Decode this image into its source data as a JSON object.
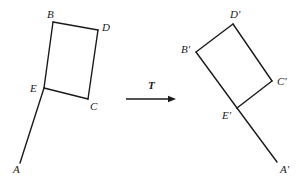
{
  "figure": {
    "caption": "",
    "background_color": "#ffffff",
    "stroke_color": "#1a1a1a",
    "label_color": "#1a1a1a",
    "width": 299,
    "height": 180
  },
  "operator": {
    "symbol": "T",
    "symbol_x": 148,
    "symbol_y": 80,
    "arrow": {
      "x1": 126,
      "y1": 99,
      "x2": 176,
      "y2": 99
    }
  },
  "preimage": {
    "name": "pre-image",
    "vertices": [
      {
        "id": "A",
        "label": "A",
        "x": 20,
        "y": 163,
        "label_x": 13,
        "label_y": 164
      },
      {
        "id": "B",
        "label": "B",
        "x": 53,
        "y": 22,
        "label_x": 47,
        "label_y": 9
      },
      {
        "id": "C",
        "label": "C",
        "x": 88,
        "y": 99,
        "label_x": 90,
        "label_y": 101
      },
      {
        "id": "D",
        "label": "D",
        "x": 98,
        "y": 30,
        "label_x": 102,
        "label_y": 22
      },
      {
        "id": "E",
        "label": "E",
        "x": 44,
        "y": 88,
        "label_x": 30,
        "label_y": 83
      }
    ],
    "edges": [
      {
        "from": "B",
        "to": "D"
      },
      {
        "from": "D",
        "to": "C"
      },
      {
        "from": "C",
        "to": "E"
      },
      {
        "from": "E",
        "to": "B"
      },
      {
        "from": "E",
        "to": "A"
      }
    ]
  },
  "image": {
    "name": "image",
    "vertices": [
      {
        "id": "A'",
        "label": "A'",
        "x": 277,
        "y": 162,
        "label_x": 280,
        "label_y": 164
      },
      {
        "id": "B'",
        "label": "B'",
        "x": 196,
        "y": 52,
        "label_x": 181,
        "label_y": 44
      },
      {
        "id": "C'",
        "label": "C'",
        "x": 272,
        "y": 81,
        "label_x": 277,
        "label_y": 76
      },
      {
        "id": "D'",
        "label": "D'",
        "x": 233,
        "y": 24,
        "label_x": 230,
        "label_y": 9
      },
      {
        "id": "E'",
        "label": "E'",
        "x": 237,
        "y": 108,
        "label_x": 222,
        "label_y": 110
      }
    ],
    "edges": [
      {
        "from": "B'",
        "to": "D'"
      },
      {
        "from": "D'",
        "to": "C'"
      },
      {
        "from": "C'",
        "to": "E'"
      },
      {
        "from": "E'",
        "to": "B'"
      },
      {
        "from": "E'",
        "to": "A'"
      }
    ]
  }
}
